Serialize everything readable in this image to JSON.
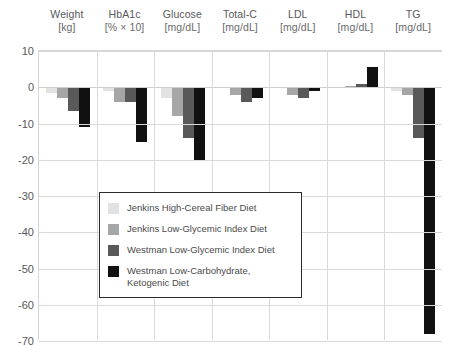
{
  "chart_data": {
    "type": "bar",
    "title": "",
    "subtitle": "",
    "xlabel": "",
    "ylabel": "",
    "ylim": [
      -70,
      10
    ],
    "yticks": [
      10,
      0,
      -10,
      -20,
      -30,
      -40,
      -50,
      -60,
      -70
    ],
    "grid": true,
    "legend_position": "inside-center-left",
    "categories": [
      {
        "name": "Weight",
        "unit": "[kg]"
      },
      {
        "name": "HbA1c",
        "unit": "[% × 10]"
      },
      {
        "name": "Glucose",
        "unit": "[mg/dL]"
      },
      {
        "name": "Total-C",
        "unit": "[mg/dL]"
      },
      {
        "name": "LDL",
        "unit": "[mg/dL]"
      },
      {
        "name": "HDL",
        "unit": "[mg/dL]"
      },
      {
        "name": "TG",
        "unit": "[mg/dL]"
      }
    ],
    "series": [
      {
        "name": "Jenkins High-Cereal Fiber Diet",
        "color": "#e2e2e2",
        "values": [
          -1.5,
          -1.0,
          -3.0,
          -0.2,
          -0.3,
          0.2,
          -1.0
        ]
      },
      {
        "name": "Jenkins Low-Glycemic Index Diet",
        "color": "#a6a6a6",
        "values": [
          -3.0,
          -4.0,
          -8.0,
          -2.0,
          -2.0,
          0.3,
          -2.0
        ]
      },
      {
        "name": "Westman Low-Glycemic Index Diet",
        "color": "#595959",
        "values": [
          -6.5,
          -4.0,
          -14.0,
          -4.0,
          -3.0,
          1.0,
          -14.0
        ]
      },
      {
        "name": "Westman Low-Carbohydrate, Ketogenic Diet",
        "color": "#111111",
        "values": [
          -11.0,
          -15.0,
          -20.0,
          -3.0,
          -1.0,
          5.5,
          -68.0
        ]
      }
    ]
  },
  "legend": {
    "items": [
      {
        "label": "Jenkins High-Cereal Fiber Diet",
        "color": "#e2e2e2"
      },
      {
        "label": "Jenkins Low-Glycemic Index Diet",
        "color": "#a6a6a6"
      },
      {
        "label": "Westman Low-Glycemic Index Diet",
        "color": "#595959"
      },
      {
        "label": "Westman Low-Carbohydrate, Ketogenic Diet",
        "color": "#111111"
      }
    ]
  },
  "colors": {
    "background": "#ffffff",
    "grid": "#d9d9d9",
    "text": "#58585a",
    "legend_border": "#2b2b2b"
  }
}
